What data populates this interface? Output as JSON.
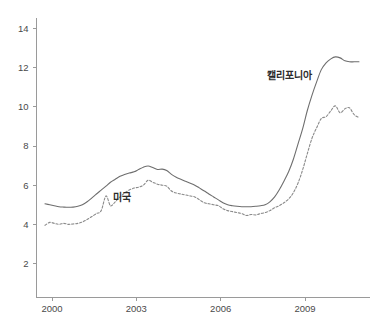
{
  "chart_data": {
    "type": "line",
    "title": "",
    "subtitle": "",
    "xlabel": "",
    "ylabel": "",
    "xlim": [
      1999.5,
      2011.2
    ],
    "ylim": [
      1.0,
      14.6
    ],
    "grid": false,
    "legend_position": "inline-annotations",
    "x_tick_labels": [
      "2000",
      "2003",
      "2006",
      "2009"
    ],
    "x_tick_values": [
      2000,
      2003,
      2006,
      2009
    ],
    "y_tick_labels": [
      "2",
      "4",
      "6",
      "8",
      "10",
      "12",
      "14"
    ],
    "y_tick_values": [
      2,
      4,
      6,
      8,
      10,
      12,
      14
    ],
    "annotations": [
      {
        "text": "캘리포니아",
        "x": 2008.45,
        "y": 11.4
      },
      {
        "text": "미국",
        "x": 2002.5,
        "y": 5.2
      }
    ],
    "series": [
      {
        "name": "캘리포니아",
        "style": "solid",
        "color": "#6e6e6e",
        "x": [
          1999.75,
          1999.92,
          2000.08,
          2000.25,
          2000.42,
          2000.58,
          2000.75,
          2000.92,
          2001.08,
          2001.25,
          2001.42,
          2001.58,
          2001.75,
          2001.92,
          2002.08,
          2002.25,
          2002.42,
          2002.58,
          2002.75,
          2002.92,
          2003.08,
          2003.25,
          2003.42,
          2003.58,
          2003.75,
          2003.92,
          2004.08,
          2004.25,
          2004.42,
          2004.58,
          2004.75,
          2004.92,
          2005.08,
          2005.25,
          2005.42,
          2005.58,
          2005.75,
          2005.92,
          2006.08,
          2006.25,
          2006.42,
          2006.58,
          2006.75,
          2006.92,
          2007.08,
          2007.25,
          2007.42,
          2007.58,
          2007.75,
          2007.92,
          2008.08,
          2008.25,
          2008.42,
          2008.58,
          2008.75,
          2008.92,
          2009.08,
          2009.25,
          2009.42,
          2009.58,
          2009.75,
          2009.92,
          2010.08,
          2010.25,
          2010.42,
          2010.58,
          2010.75,
          2010.92
        ],
        "values": [
          5.05,
          5.0,
          4.95,
          4.9,
          4.88,
          4.87,
          4.88,
          4.92,
          5.0,
          5.15,
          5.35,
          5.55,
          5.75,
          5.95,
          6.15,
          6.3,
          6.45,
          6.55,
          6.62,
          6.68,
          6.8,
          6.92,
          6.98,
          6.9,
          6.8,
          6.82,
          6.75,
          6.55,
          6.4,
          6.3,
          6.2,
          6.1,
          6.0,
          5.85,
          5.7,
          5.55,
          5.4,
          5.25,
          5.1,
          5.0,
          4.95,
          4.92,
          4.9,
          4.9,
          4.9,
          4.92,
          4.95,
          5.0,
          5.15,
          5.4,
          5.75,
          6.2,
          6.7,
          7.3,
          8.1,
          8.9,
          9.8,
          10.6,
          11.3,
          11.9,
          12.25,
          12.45,
          12.55,
          12.5,
          12.35,
          12.3,
          12.3,
          12.3
        ]
      },
      {
        "name": "미국",
        "style": "dashed",
        "color": "#8a8a8a",
        "x": [
          1999.75,
          1999.92,
          2000.08,
          2000.25,
          2000.42,
          2000.58,
          2000.75,
          2000.92,
          2001.08,
          2001.25,
          2001.42,
          2001.58,
          2001.75,
          2001.92,
          2002.08,
          2002.25,
          2002.42,
          2002.58,
          2002.75,
          2002.92,
          2003.08,
          2003.25,
          2003.42,
          2003.58,
          2003.75,
          2003.92,
          2004.08,
          2004.25,
          2004.42,
          2004.58,
          2004.75,
          2004.92,
          2005.08,
          2005.25,
          2005.42,
          2005.58,
          2005.75,
          2005.92,
          2006.08,
          2006.25,
          2006.42,
          2006.58,
          2006.75,
          2006.92,
          2007.08,
          2007.25,
          2007.42,
          2007.58,
          2007.75,
          2007.92,
          2008.08,
          2008.25,
          2008.42,
          2008.58,
          2008.75,
          2008.92,
          2009.08,
          2009.25,
          2009.42,
          2009.58,
          2009.75,
          2009.92,
          2010.08,
          2010.25,
          2010.42,
          2010.58,
          2010.75,
          2010.92
        ],
        "values": [
          3.95,
          4.1,
          4.05,
          4.0,
          4.05,
          4.0,
          4.02,
          4.05,
          4.12,
          4.25,
          4.4,
          4.55,
          4.7,
          5.45,
          4.95,
          5.15,
          5.4,
          5.6,
          5.75,
          5.85,
          5.9,
          6.0,
          6.25,
          6.15,
          6.05,
          6.0,
          5.95,
          5.7,
          5.6,
          5.55,
          5.5,
          5.45,
          5.4,
          5.25,
          5.1,
          5.05,
          5.0,
          4.95,
          4.8,
          4.7,
          4.65,
          4.6,
          4.55,
          4.45,
          4.5,
          4.48,
          4.55,
          4.6,
          4.7,
          4.85,
          4.95,
          5.1,
          5.3,
          5.6,
          6.1,
          6.8,
          7.6,
          8.4,
          8.95,
          9.4,
          9.5,
          9.8,
          10.05,
          9.7,
          9.9,
          9.95,
          9.6,
          9.45
        ]
      }
    ]
  }
}
